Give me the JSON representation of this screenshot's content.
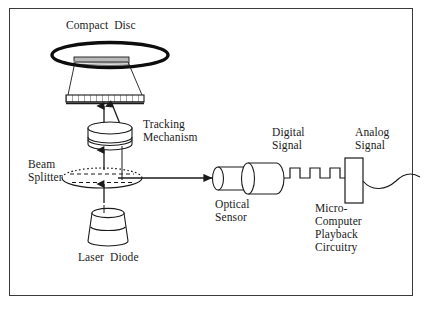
{
  "figure": {
    "background_color": "#ffffff",
    "border_color": "#3a3a3a",
    "ink_color": "#1a1a1a"
  },
  "labels": {
    "compact_disc": "Compact  Disc",
    "tracking_mechanism": "Tracking\nMechanism",
    "beam_splitter": "Beam\nSplitter",
    "laser_diode": "Laser  Diode",
    "optical_sensor": "Optical\nSensor",
    "digital_signal": "Digital\nSignal",
    "analog_signal": "Analog\nSignal",
    "microcomputer": "Micro-\nComputer\nPlayback\nCircuitry"
  },
  "components": [
    {
      "name": "compact-disc",
      "shape": "ellipse-disc",
      "label": "Compact  Disc"
    },
    {
      "name": "objective-lens-plate",
      "shape": "hatched-plate",
      "label": ""
    },
    {
      "name": "tracking-mechanism",
      "shape": "cylinder",
      "label": "Tracking Mechanism"
    },
    {
      "name": "beam-splitter",
      "shape": "dashed-ellipse",
      "label": "Beam Splitter"
    },
    {
      "name": "laser-diode",
      "shape": "truncated-cone",
      "label": "Laser  Diode"
    },
    {
      "name": "optical-sensor",
      "shape": "double-cylinder",
      "label": "Optical Sensor"
    },
    {
      "name": "microcomputer-box",
      "shape": "rectangle",
      "label": "Micro-Computer Playback Circuitry"
    }
  ],
  "signals": {
    "digital": {
      "type": "square-wave",
      "pulses": 3,
      "label": "Digital Signal"
    },
    "analog": {
      "type": "sine-wave",
      "label": "Analog Signal"
    }
  },
  "beams": [
    {
      "name": "laser-to-splitter",
      "direction": "up"
    },
    {
      "name": "splitter-to-tracking",
      "direction": "up"
    },
    {
      "name": "tracking-to-lens",
      "direction": "up"
    },
    {
      "name": "lens-return-down",
      "direction": "down"
    },
    {
      "name": "splitter-to-sensor",
      "direction": "right"
    }
  ]
}
